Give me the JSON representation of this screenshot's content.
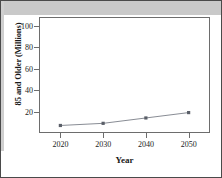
{
  "chart_data": {
    "type": "line",
    "title": "",
    "xlabel": "Year",
    "ylabel": "85 and Older (Millions)",
    "x": [
      2020,
      2030,
      2040,
      2050
    ],
    "categories": [
      "2020",
      "2030",
      "2040",
      "2050"
    ],
    "values": [
      7,
      9,
      14,
      19
    ],
    "series": [
      {
        "name": "85 and Older (Millions)",
        "values": [
          7,
          9,
          14,
          19
        ]
      }
    ],
    "xtick_labels": [
      "2020",
      "2030",
      "2040",
      "2050"
    ],
    "ytick_labels": [
      "20",
      "40",
      "60",
      "80",
      "100"
    ],
    "ytick_values": [
      20,
      40,
      60,
      80,
      100
    ],
    "xlim": [
      2015,
      2055
    ],
    "ylim": [
      0,
      108
    ],
    "grid": false,
    "legend": false,
    "marker": "square",
    "line_color": "#7b7f88",
    "marker_color": "#5a5f68",
    "plot_background": "#ffffff",
    "frame_color": "#6d6d6d",
    "figure_border_color": "#4a4a4a",
    "band_color": "#c9c9c9"
  }
}
